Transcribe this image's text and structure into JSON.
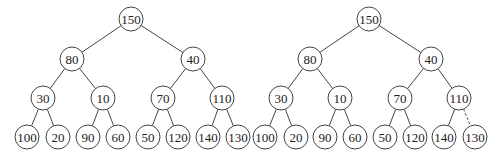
{
  "colors": {
    "stroke": "#444444",
    "node_fill": "#ffffff",
    "text": "#222222",
    "background": "#ffffff"
  },
  "node_radius": 12,
  "trees": [
    {
      "id": "left-tree",
      "nodes": [
        {
          "id": "n0",
          "value": "150",
          "x": 131,
          "y": 19
        },
        {
          "id": "n1",
          "value": "80",
          "x": 72,
          "y": 59
        },
        {
          "id": "n2",
          "value": "40",
          "x": 193,
          "y": 59
        },
        {
          "id": "n3",
          "value": "30",
          "x": 43,
          "y": 98
        },
        {
          "id": "n4",
          "value": "10",
          "x": 103,
          "y": 98
        },
        {
          "id": "n5",
          "value": "70",
          "x": 163,
          "y": 98
        },
        {
          "id": "n6",
          "value": "110",
          "x": 222,
          "y": 98
        },
        {
          "id": "n7",
          "value": "100",
          "x": 27,
          "y": 137
        },
        {
          "id": "n8",
          "value": "20",
          "x": 58,
          "y": 137
        },
        {
          "id": "n9",
          "value": "90",
          "x": 88,
          "y": 137
        },
        {
          "id": "n10",
          "value": "60",
          "x": 118,
          "y": 137
        },
        {
          "id": "n11",
          "value": "50",
          "x": 148,
          "y": 137
        },
        {
          "id": "n12",
          "value": "120",
          "x": 178,
          "y": 137
        },
        {
          "id": "n13",
          "value": "140",
          "x": 208,
          "y": 137
        },
        {
          "id": "n14",
          "value": "130",
          "x": 238,
          "y": 137
        }
      ],
      "edges": [
        {
          "from": "n0",
          "to": "n1",
          "style": "solid"
        },
        {
          "from": "n0",
          "to": "n2",
          "style": "solid"
        },
        {
          "from": "n1",
          "to": "n3",
          "style": "solid"
        },
        {
          "from": "n1",
          "to": "n4",
          "style": "solid"
        },
        {
          "from": "n2",
          "to": "n5",
          "style": "solid"
        },
        {
          "from": "n2",
          "to": "n6",
          "style": "solid"
        },
        {
          "from": "n3",
          "to": "n7",
          "style": "solid"
        },
        {
          "from": "n3",
          "to": "n8",
          "style": "solid"
        },
        {
          "from": "n4",
          "to": "n9",
          "style": "solid"
        },
        {
          "from": "n4",
          "to": "n10",
          "style": "solid"
        },
        {
          "from": "n5",
          "to": "n11",
          "style": "solid"
        },
        {
          "from": "n5",
          "to": "n12",
          "style": "solid"
        },
        {
          "from": "n6",
          "to": "n13",
          "style": "solid"
        },
        {
          "from": "n6",
          "to": "n14",
          "style": "solid"
        }
      ]
    },
    {
      "id": "right-tree",
      "nodes": [
        {
          "id": "m0",
          "value": "150",
          "x": 369,
          "y": 19
        },
        {
          "id": "m1",
          "value": "80",
          "x": 310,
          "y": 59
        },
        {
          "id": "m2",
          "value": "40",
          "x": 431,
          "y": 59
        },
        {
          "id": "m3",
          "value": "30",
          "x": 281,
          "y": 98
        },
        {
          "id": "m4",
          "value": "10",
          "x": 340,
          "y": 98
        },
        {
          "id": "m5",
          "value": "70",
          "x": 400,
          "y": 98
        },
        {
          "id": "m6",
          "value": "110",
          "x": 459,
          "y": 98
        },
        {
          "id": "m7",
          "value": "100",
          "x": 265,
          "y": 137
        },
        {
          "id": "m8",
          "value": "20",
          "x": 296,
          "y": 137
        },
        {
          "id": "m9",
          "value": "90",
          "x": 325,
          "y": 137
        },
        {
          "id": "m10",
          "value": "60",
          "x": 355,
          "y": 137
        },
        {
          "id": "m11",
          "value": "50",
          "x": 385,
          "y": 137
        },
        {
          "id": "m12",
          "value": "120",
          "x": 415,
          "y": 137
        },
        {
          "id": "m13",
          "value": "140",
          "x": 444,
          "y": 137
        },
        {
          "id": "m14",
          "value": "130",
          "x": 475,
          "y": 137
        }
      ],
      "edges": [
        {
          "from": "m0",
          "to": "m1",
          "style": "solid"
        },
        {
          "from": "m0",
          "to": "m2",
          "style": "solid"
        },
        {
          "from": "m1",
          "to": "m3",
          "style": "solid"
        },
        {
          "from": "m1",
          "to": "m4",
          "style": "solid"
        },
        {
          "from": "m2",
          "to": "m5",
          "style": "solid"
        },
        {
          "from": "m2",
          "to": "m6",
          "style": "solid"
        },
        {
          "from": "m3",
          "to": "m7",
          "style": "solid"
        },
        {
          "from": "m3",
          "to": "m8",
          "style": "solid"
        },
        {
          "from": "m4",
          "to": "m9",
          "style": "solid"
        },
        {
          "from": "m4",
          "to": "m10",
          "style": "solid"
        },
        {
          "from": "m5",
          "to": "m11",
          "style": "solid"
        },
        {
          "from": "m5",
          "to": "m12",
          "style": "solid"
        },
        {
          "from": "m6",
          "to": "m13",
          "style": "solid"
        },
        {
          "from": "m6",
          "to": "m14",
          "style": "dashed"
        }
      ]
    }
  ]
}
